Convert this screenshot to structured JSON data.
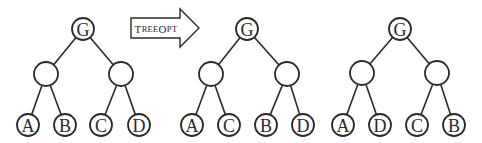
{
  "diagram": {
    "arrow": {
      "label_big_1": "T",
      "label_small_1": "REE",
      "label_big_2": "O",
      "label_small_2": "PT",
      "full_label": "TreeOpt"
    },
    "trees": [
      {
        "name": "original-tree",
        "root": {
          "label": "G",
          "x": 83,
          "y": 29
        },
        "internal": [
          {
            "label": "",
            "x": 46,
            "y": 74
          },
          {
            "label": "",
            "x": 121,
            "y": 74
          }
        ],
        "leaves": [
          {
            "label": "A",
            "x": 28,
            "y": 125
          },
          {
            "label": "B",
            "x": 65,
            "y": 125
          },
          {
            "label": "C",
            "x": 101,
            "y": 125
          },
          {
            "label": "D",
            "x": 139,
            "y": 125
          }
        ]
      },
      {
        "name": "optimized-tree-1",
        "root": {
          "label": "G",
          "x": 247,
          "y": 29
        },
        "internal": [
          {
            "label": "",
            "x": 211,
            "y": 74
          },
          {
            "label": "",
            "x": 287,
            "y": 74
          }
        ],
        "leaves": [
          {
            "label": "A",
            "x": 192,
            "y": 125
          },
          {
            "label": "C",
            "x": 229,
            "y": 125
          },
          {
            "label": "B",
            "x": 266,
            "y": 125
          },
          {
            "label": "D",
            "x": 303,
            "y": 125
          }
        ]
      },
      {
        "name": "optimized-tree-2",
        "root": {
          "label": "G",
          "x": 400,
          "y": 29
        },
        "internal": [
          {
            "label": "",
            "x": 362,
            "y": 73
          },
          {
            "label": "",
            "x": 437,
            "y": 73
          }
        ],
        "leaves": [
          {
            "label": "A",
            "x": 343,
            "y": 125
          },
          {
            "label": "D",
            "x": 380,
            "y": 125
          },
          {
            "label": "C",
            "x": 417,
            "y": 125
          },
          {
            "label": "B",
            "x": 454,
            "y": 125
          }
        ]
      }
    ]
  }
}
